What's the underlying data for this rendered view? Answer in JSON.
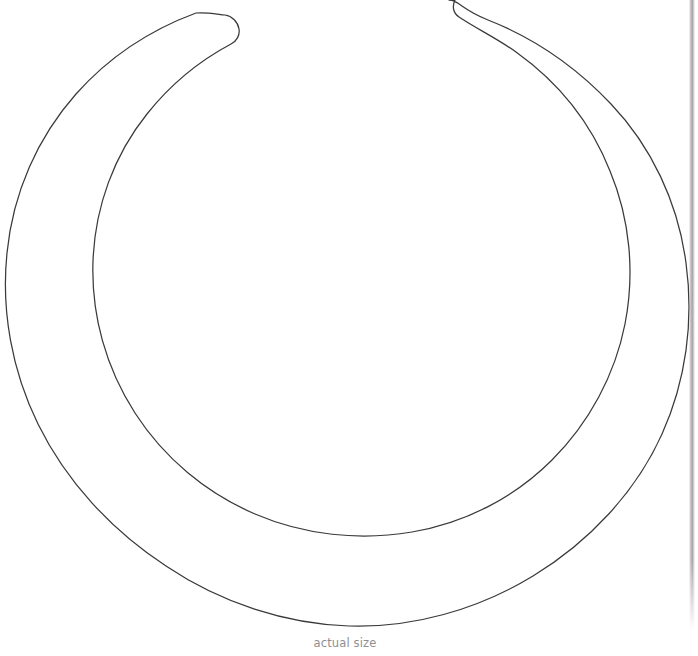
{
  "page": {
    "width": 698,
    "height": 656,
    "background_color": "#ffffff",
    "top_cut_text": "",
    "page_edge_shadow_color": "#a9a9ae"
  },
  "figure": {
    "name": "open-ring-line-drawing",
    "stroke_color": "#3a3a3a",
    "fill_color": "none",
    "stroke_width": 1,
    "outer_center_x": 343,
    "outer_center_y": 313,
    "outer_radius": 336,
    "inner_center_x": 344,
    "inner_center_y": 300,
    "inner_radius": 273,
    "gap_left_terminal_x": 222,
    "gap_right_terminal_x": 455,
    "gap_top_y": 0
  },
  "caption": {
    "text": "actual size",
    "color": "#8f8f93",
    "font_size_px": 11.5,
    "center_x": 345,
    "baseline_y": 648
  }
}
